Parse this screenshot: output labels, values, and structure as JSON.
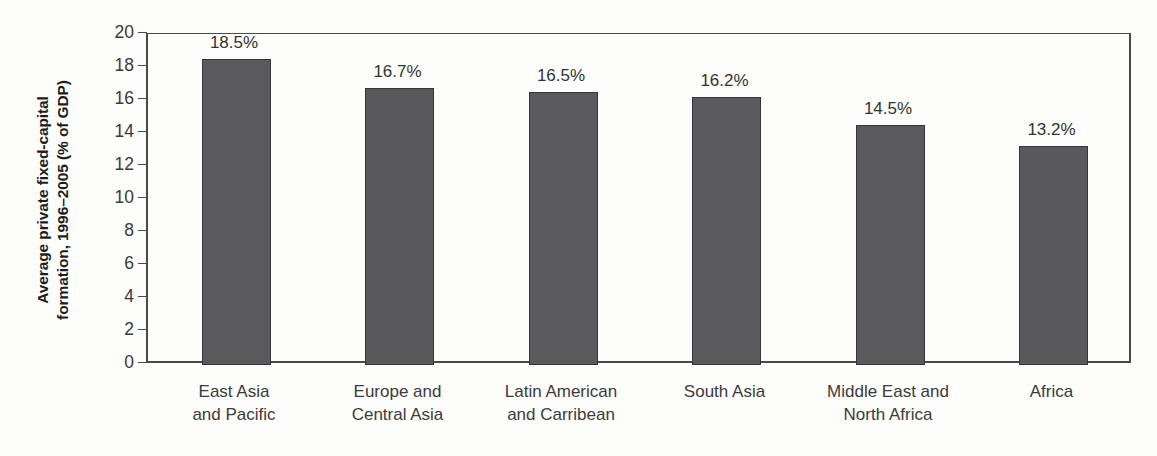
{
  "chart_data": {
    "type": "bar",
    "title": "",
    "subtitle": "",
    "xlabel": "",
    "ylabel": "Average private fixed-capital formation, 1996–2005 (% of GDP)",
    "ylabel_lines": [
      "Average private fixed-capital",
      "formation, 1996–2005 (% of GDP)"
    ],
    "categories": [
      "East Asia and Pacific",
      "Europe and Central Asia",
      "Latin American and Carribean",
      "South Asia",
      "Middle East and North Africa",
      "Africa"
    ],
    "category_lines": [
      [
        "East Asia",
        "and Pacific"
      ],
      [
        "Europe and",
        "Central Asia"
      ],
      [
        "Latin American",
        "and Carribean"
      ],
      [
        "South Asia"
      ],
      [
        "Middle East and",
        "North Africa"
      ],
      [
        "Africa"
      ]
    ],
    "values": [
      18.5,
      16.7,
      16.5,
      16.2,
      14.5,
      13.2
    ],
    "value_labels": [
      "18.5%",
      "16.7%",
      "16.5%",
      "16.2%",
      "14.5%",
      "13.2%"
    ],
    "ylim": [
      0,
      20
    ],
    "ytick_labels": [
      "20",
      "18",
      "16",
      "14",
      "12",
      "10",
      "8",
      "6",
      "4",
      "2",
      "0"
    ],
    "ytick_values": [
      20,
      18,
      16,
      14,
      12,
      10,
      8,
      6,
      4,
      2,
      0
    ],
    "grid": false,
    "legend": null,
    "bar_color": "#57575a",
    "axis_color": "#4a4a4a",
    "text_color": "#333333",
    "background_color": "#fdfdfb"
  }
}
